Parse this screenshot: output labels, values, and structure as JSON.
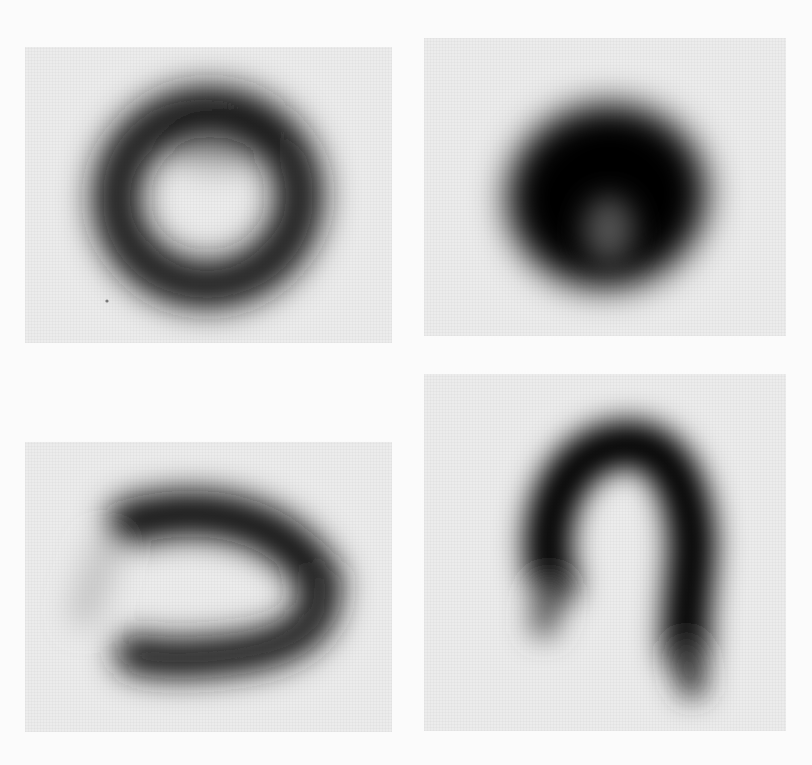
{
  "figure": {
    "layout": "2x2 grid of grayscale blurred scintigraphy-like images",
    "background": "#fbfbfb",
    "panel_background": "#ececec",
    "ink_color": "#000000",
    "panels": [
      {
        "id": "top-left",
        "shape": "ring / donut with light center",
        "left": 25,
        "top": 47,
        "width": 367,
        "height": 296
      },
      {
        "id": "top-right",
        "shape": "dense dark blob with faint lighter notch at bottom-center",
        "left": 424,
        "top": 38,
        "width": 362,
        "height": 298
      },
      {
        "id": "bottom-left",
        "shape": "horizontal horseshoe / U open to left",
        "left": 25,
        "top": 442,
        "width": 367,
        "height": 290
      },
      {
        "id": "bottom-right",
        "shape": "inverted U / hook open downward",
        "left": 424,
        "top": 374,
        "width": 362,
        "height": 357
      }
    ]
  }
}
